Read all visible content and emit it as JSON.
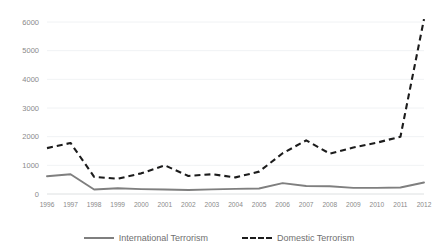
{
  "chart_data": {
    "type": "line",
    "title": "",
    "xlabel": "",
    "ylabel": "",
    "categories": [
      "1996",
      "1997",
      "1998",
      "1999",
      "2000",
      "2001",
      "2002",
      "2003",
      "2004",
      "2005",
      "2006",
      "2007",
      "2008",
      "2009",
      "2010",
      "2011",
      "2012"
    ],
    "x": [
      1996,
      1997,
      1998,
      1999,
      2000,
      2001,
      2002,
      2003,
      2004,
      2005,
      2006,
      2007,
      2008,
      2009,
      2010,
      2011,
      2012
    ],
    "series": [
      {
        "name": "International Terrorism",
        "style": "solid",
        "color": "#7f7f7f",
        "values": [
          620,
          690,
          155,
          200,
          170,
          155,
          140,
          160,
          180,
          190,
          380,
          280,
          270,
          215,
          215,
          225,
          400
        ]
      },
      {
        "name": "Domestic Terrorism",
        "style": "dashed",
        "color": "#1c1c1c",
        "values": [
          1600,
          1780,
          600,
          530,
          720,
          1000,
          630,
          690,
          580,
          780,
          1420,
          1870,
          1410,
          1620,
          1790,
          2000,
          6100
        ]
      }
    ],
    "ylim": [
      0,
      6000
    ],
    "xlim": [
      1996,
      2012
    ],
    "yticks": [
      0,
      1000,
      2000,
      3000,
      4000,
      5000,
      6000
    ],
    "ytick_labels": [
      "0",
      "1000",
      "2000",
      "3000",
      "4000",
      "5000",
      "6000"
    ],
    "grid": true,
    "grid_axis": "y",
    "legend_position": "bottom"
  },
  "legend": {
    "entries": [
      {
        "label": "International Terrorism",
        "swatch": "solid-line-swatch"
      },
      {
        "label": "Domestic Terrorism",
        "swatch": "dashed-line-swatch"
      }
    ]
  }
}
